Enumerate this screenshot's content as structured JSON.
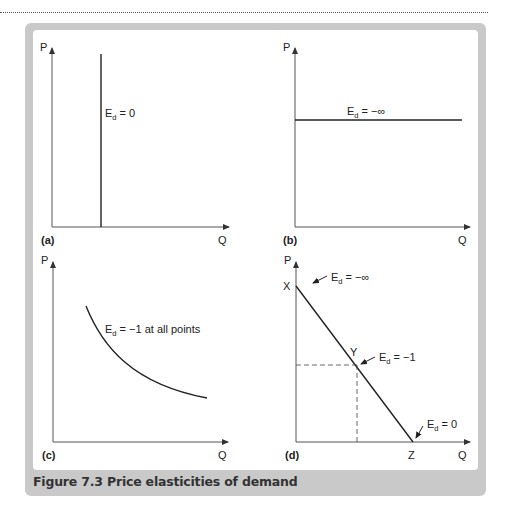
{
  "figure": {
    "caption": "Figure 7.3 Price elasticities of demand",
    "colors": {
      "frame": "#c9c9c9",
      "line": "#222222",
      "axis": "#555555",
      "background": "#ffffff"
    }
  },
  "panels": [
    {
      "id": "a",
      "label": "(a)",
      "y_axis": "P",
      "x_axis": "Q",
      "curve_type": "vertical line (perfectly inelastic)",
      "annotation": {
        "main": "E",
        "sub": "d",
        "rest": " = 0"
      }
    },
    {
      "id": "b",
      "label": "(b)",
      "y_axis": "P",
      "x_axis": "Q",
      "curve_type": "horizontal line (perfectly elastic)",
      "annotation": {
        "main": "E",
        "sub": "d",
        "rest": " = −∞"
      }
    },
    {
      "id": "c",
      "label": "(c)",
      "y_axis": "P",
      "x_axis": "Q",
      "curve_type": "rectangular hyperbola (unit elastic)",
      "annotation": {
        "main": "E",
        "sub": "d",
        "rest": " = −1 at all points"
      }
    },
    {
      "id": "d",
      "label": "(d)",
      "y_axis": "P",
      "x_axis": "Q",
      "curve_type": "straight-line demand curve",
      "points": {
        "x_point": "X",
        "y_point": "Y",
        "z_point": "Z"
      },
      "annotations": {
        "top": {
          "main": "E",
          "sub": "d",
          "rest": " = −∞"
        },
        "mid": {
          "main": "E",
          "sub": "d",
          "rest": " = −1"
        },
        "bottom": {
          "main": "E",
          "sub": "d",
          "rest": " = 0"
        }
      }
    }
  ]
}
